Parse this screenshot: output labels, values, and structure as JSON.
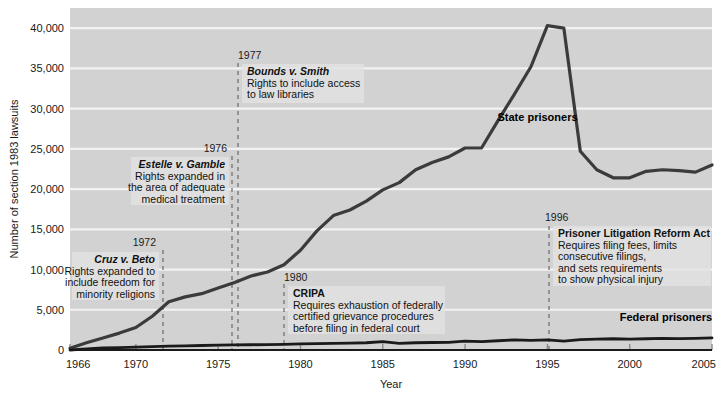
{
  "chart_data": {
    "type": "line",
    "title": "",
    "xlabel": "Year",
    "ylabel": "Number of section 1983 lawsuits",
    "xlim": [
      1966,
      2005
    ],
    "ylim": [
      0,
      42500
    ],
    "grid": true,
    "legend_position": "inline-labels",
    "x_ticks": [
      "1966",
      "1970",
      "1975",
      "1980",
      "1985",
      "1990",
      "1995",
      "2000",
      "2005"
    ],
    "x_tick_values": [
      1966,
      1970,
      1975,
      1980,
      1985,
      1990,
      1995,
      2000,
      2005
    ],
    "y_ticks": [
      "0",
      "5,000",
      "10,000",
      "15,000",
      "20,000",
      "25,000",
      "30,000",
      "35,000",
      "40,000"
    ],
    "y_tick_values": [
      0,
      5000,
      10000,
      15000,
      20000,
      25000,
      30000,
      35000,
      40000
    ],
    "x": [
      1966,
      1967,
      1968,
      1969,
      1970,
      1971,
      1972,
      1973,
      1974,
      1975,
      1976,
      1977,
      1978,
      1979,
      1980,
      1981,
      1982,
      1983,
      1984,
      1985,
      1986,
      1987,
      1988,
      1989,
      1990,
      1991,
      1992,
      1993,
      1994,
      1995,
      1996,
      1997,
      1998,
      1999,
      2000,
      2001,
      2002,
      2003,
      2004,
      2005
    ],
    "series": [
      {
        "name": "State prisoners",
        "color": "#3b3b3b",
        "values": [
          218,
          900,
          1500,
          2100,
          2800,
          4200,
          6000,
          6600,
          7000,
          7700,
          8400,
          9200,
          9700,
          10600,
          12400,
          14800,
          16700,
          17400,
          18500,
          19900,
          20800,
          22400,
          23300,
          24000,
          25100,
          25100,
          28500,
          31800,
          35200,
          40300,
          40000,
          24700,
          22400,
          21400,
          21400,
          22200,
          22400,
          22300,
          22100,
          23000
        ]
      },
      {
        "name": "Federal prisoners",
        "color": "#1a1a1a",
        "values": [
          0,
          150,
          250,
          300,
          350,
          420,
          480,
          520,
          560,
          600,
          630,
          650,
          680,
          700,
          750,
          800,
          830,
          860,
          900,
          1050,
          830,
          900,
          930,
          950,
          1100,
          1050,
          1150,
          1250,
          1200,
          1250,
          1100,
          1300,
          1350,
          1400,
          1350,
          1400,
          1450,
          1420,
          1450,
          1500
        ]
      }
    ],
    "series_labels": [
      {
        "name": "State prisoners",
        "text": "State prisoners",
        "x": 1994.4,
        "y": 28400
      },
      {
        "name": "Federal prisoners",
        "text": "Federal prisoners",
        "x": 2002.2,
        "y": 3600
      }
    ],
    "annotations": [
      {
        "id": "cruz-v-beto",
        "year_label": "1972",
        "year": 1972,
        "title": "Cruz v. Beto",
        "title_italic": true,
        "lines": [
          "Rights expanded to",
          "include freedom for",
          "minority religions"
        ],
        "align": "right",
        "box_x": 72,
        "box_y": 252,
        "box_w": 87,
        "box_h": 48,
        "year_x": 156,
        "year_y": 246,
        "line_x": 163,
        "line_top": 250,
        "line_bottom": 350
      },
      {
        "id": "estelle-v-gamble",
        "year_label": "1976",
        "year": 1976,
        "title": "Estelle v. Gamble",
        "title_italic": true,
        "lines": [
          "Rights expanded in",
          "the area of adequate",
          "medical treatment"
        ],
        "align": "right",
        "box_x": 131,
        "box_y": 157,
        "box_w": 98,
        "box_h": 48,
        "year_x": 227,
        "year_y": 152,
        "line_x": 232,
        "line_top": 156,
        "line_bottom": 350
      },
      {
        "id": "bounds-v-smith",
        "year_label": "1977",
        "year": 1977,
        "title": "Bounds v. Smith",
        "title_italic": true,
        "lines": [
          "Rights to include access",
          "to law libraries"
        ],
        "align": "left",
        "box_x": 242,
        "box_y": 64,
        "box_w": 122,
        "box_h": 39,
        "year_x": 238,
        "year_y": 59,
        "line_x": 238,
        "line_top": 63,
        "line_bottom": 350
      },
      {
        "id": "cripa",
        "year_label": "1980",
        "year": 1980,
        "title": "CRIPA",
        "title_italic": false,
        "lines": [
          "Requires exhaustion of federally",
          "certified grievance procedures",
          "before filing in federal court"
        ],
        "align": "left",
        "box_x": 288,
        "box_y": 286,
        "box_w": 157,
        "box_h": 48,
        "year_x": 284,
        "year_y": 281,
        "line_x": 284,
        "line_top": 284,
        "line_bottom": 350
      },
      {
        "id": "plra",
        "year_label": "1996",
        "year": 1996,
        "title": "Prisoner Litigation Reform Act",
        "title_italic": false,
        "lines": [
          "Requires filing fees, limits",
          "consecutive filings,",
          "and sets requirements",
          "to show physical injury"
        ],
        "align": "left",
        "box_x": 553,
        "box_y": 226,
        "box_w": 158,
        "box_h": 60,
        "year_x": 545,
        "year_y": 221,
        "line_x": 549,
        "line_top": 226,
        "line_bottom": 350
      }
    ],
    "colors": {
      "plot_background": "#d2d2d2",
      "gridline": "#f2f2f2",
      "axis": "#1a1a1a",
      "annotation_box": "#e2e2e2",
      "state_line": "#3b3b3b",
      "federal_line": "#1a1a1a",
      "dashed_guide": "#6a6a6a"
    }
  }
}
